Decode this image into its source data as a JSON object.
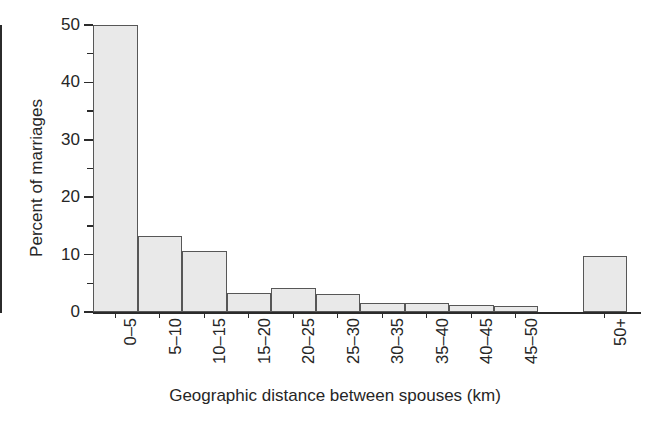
{
  "chart_data": {
    "type": "bar",
    "title": "",
    "subtitle": "",
    "xlabel": "Geographic distance between spouses (km)",
    "ylabel": "Percent of marriages",
    "categories": [
      "0–5",
      "5–10",
      "10–15",
      "15–20",
      "20–25",
      "25–30",
      "30–35",
      "35–40",
      "40–45",
      "45–50",
      "50+"
    ],
    "values": [
      50.0,
      13.3,
      10.7,
      3.3,
      4.2,
      3.1,
      1.6,
      1.6,
      1.3,
      1.0,
      9.7
    ],
    "ylim": [
      0,
      50
    ],
    "y_major_ticks": [
      0,
      10,
      20,
      30,
      40,
      50
    ],
    "y_minor_ticks": [
      5,
      15,
      25,
      35,
      45
    ],
    "y_tick_labels": [
      "0",
      "10",
      "20",
      "30",
      "40",
      "50"
    ],
    "grid": false,
    "legend": false,
    "legend_position": "none",
    "bar_fill_color": "#e9e9e9",
    "bar_edge_color": "#575757",
    "axis_color": "#2b2b2b",
    "text_color": "#262626",
    "background_color": "#ffffff"
  },
  "axes": {
    "y_title": "Percent of marriages",
    "x_title": "Geographic distance between spouses (km)"
  }
}
